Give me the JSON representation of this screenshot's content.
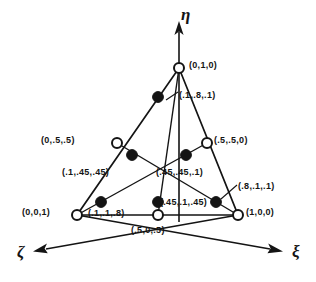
{
  "figure": {
    "colors": {
      "ink": "#141414",
      "background": "#ffffff",
      "filled_node": "#141414",
      "open_node_fill": "#ffffff"
    }
  },
  "axes": [
    {
      "name": "eta-axis",
      "symbol": "η",
      "direction": "up",
      "x": 181,
      "y": 6
    },
    {
      "name": "zeta-axis",
      "symbol": "ζ",
      "direction": "lower-left",
      "x": 17,
      "y": 243
    },
    {
      "name": "xi-axis",
      "symbol": "ξ",
      "direction": "lower-right",
      "x": 292,
      "y": 243
    }
  ],
  "nodes": {
    "vertices": [
      {
        "name": "node-apex",
        "label": "(0,1,0)",
        "marker": "open",
        "x": 179,
        "y": 68,
        "lx": 189,
        "ly": 61
      },
      {
        "name": "node-left-corner",
        "label": "(0,0,1)",
        "marker": "open",
        "x": 77,
        "y": 215,
        "lx": 22,
        "ly": 208
      },
      {
        "name": "node-right-corner",
        "label": "(1,0,0)",
        "marker": "open",
        "x": 238,
        "y": 215,
        "lx": 246,
        "ly": 208
      }
    ],
    "edge_midpoints": [
      {
        "name": "node-left-mid",
        "label": "(0,.5,.5)",
        "marker": "open",
        "x": 117,
        "y": 143,
        "lx": 41,
        "ly": 136
      },
      {
        "name": "node-right-mid",
        "label": "(.5,.5,0)",
        "marker": "open",
        "x": 207,
        "y": 143,
        "lx": 214,
        "ly": 136
      },
      {
        "name": "node-bottom-mid",
        "label": "(.5,0,.5)",
        "marker": "open",
        "x": 158,
        "y": 215,
        "lx": 131,
        "ly": 226
      }
    ],
    "interior": [
      {
        "name": "node-top-interior",
        "label": "(.1,.8,.1)",
        "marker": "filled",
        "x": 158,
        "y": 97,
        "lx": 179,
        "ly": 91,
        "leader": [
          [
            166,
            98
          ],
          [
            176,
            95
          ]
        ]
      },
      {
        "name": "node-left-upper-interior",
        "label": "(.1,.45,.45)",
        "marker": "filled",
        "x": 132,
        "y": 155,
        "lx": 62,
        "ly": 168,
        "leader": []
      },
      {
        "name": "node-right-upper-interior",
        "label": "(.45,.45,.1)",
        "marker": "filled",
        "x": 186,
        "y": 155,
        "lx": 156,
        "ly": 168,
        "leader": []
      },
      {
        "name": "node-left-lower-interior",
        "label": "(.1,.1,.8)",
        "marker": "filled",
        "x": 101,
        "y": 202,
        "lx": 88,
        "ly": 209,
        "leader": []
      },
      {
        "name": "node-bottom-interior",
        "label": "(.45,.1,.45)",
        "marker": "filled",
        "x": 158,
        "y": 202,
        "lx": 160,
        "ly": 199,
        "leader": []
      },
      {
        "name": "node-right-lower-interior",
        "label": "(.8,.1,.1)",
        "marker": "filled",
        "x": 216,
        "y": 202,
        "lx": 238,
        "ly": 182,
        "leader": [
          [
            222,
            198
          ],
          [
            236,
            186
          ]
        ]
      }
    ]
  }
}
